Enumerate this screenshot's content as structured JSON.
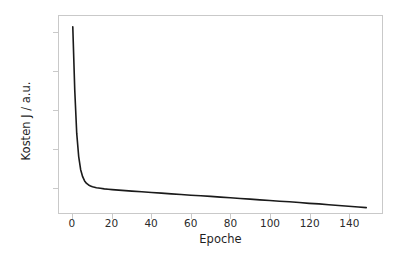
{
  "chart_data": {
    "type": "line",
    "title": "",
    "xlabel": "Epoche",
    "ylabel": "Kosten J / a.u.",
    "xlim": [
      -7,
      157
    ],
    "ylim": [
      0.0268,
      0.1288
    ],
    "grid": false,
    "legend": null,
    "xticks": [
      0,
      20,
      40,
      60,
      80,
      100,
      120,
      140
    ],
    "xtick_labels": [
      "0",
      "20",
      "40",
      "60",
      "80",
      "100",
      "120",
      "140"
    ],
    "yticks": [
      0.04,
      0.06,
      0.08,
      0.1,
      0.12
    ],
    "ytick_labels": [
      "0.04",
      "0.06",
      "0.08",
      "0.10",
      "0.12"
    ],
    "line_color": "#1a1a1a",
    "line_width": 1.6,
    "series": [
      {
        "name": "Kosten J",
        "x": [
          0,
          1,
          2,
          3,
          4,
          5,
          6,
          7,
          8,
          9,
          10,
          12,
          14,
          16,
          18,
          20,
          25,
          30,
          35,
          40,
          45,
          50,
          55,
          60,
          65,
          70,
          75,
          80,
          85,
          90,
          95,
          100,
          105,
          110,
          115,
          120,
          125,
          130,
          135,
          140,
          145,
          149
        ],
        "y": [
          0.1232,
          0.0905,
          0.068,
          0.056,
          0.0492,
          0.0456,
          0.0434,
          0.0421,
          0.0413,
          0.0408,
          0.0404,
          0.0399,
          0.0396,
          0.0393,
          0.0391,
          0.0389,
          0.0385,
          0.0381,
          0.0378,
          0.0374,
          0.0371,
          0.0367,
          0.0364,
          0.036,
          0.0357,
          0.0354,
          0.035,
          0.0347,
          0.0343,
          0.034,
          0.0336,
          0.0333,
          0.0329,
          0.0326,
          0.0322,
          0.0318,
          0.0315,
          0.0311,
          0.0307,
          0.0303,
          0.0299,
          0.0296
        ]
      }
    ]
  },
  "axes": {
    "xlabel": "Epoche",
    "ylabel": "Kosten J / a.u."
  }
}
